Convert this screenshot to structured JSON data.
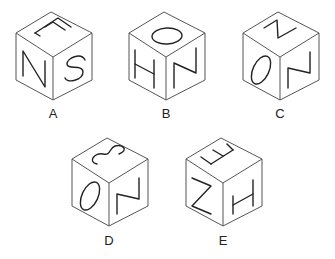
{
  "puzzle": {
    "type": "cube-net-options",
    "options": [
      {
        "label": "A",
        "faces": {
          "top": "F (rotated)",
          "left": "N",
          "right": "S"
        }
      },
      {
        "label": "B",
        "faces": {
          "top": "O",
          "left": "H (rotated)",
          "right": "N"
        }
      },
      {
        "label": "C",
        "faces": {
          "top": "N (rotated)",
          "left": "O",
          "right": "N"
        }
      },
      {
        "label": "D",
        "faces": {
          "top": "S (rotated)",
          "left": "O",
          "right": "N"
        }
      },
      {
        "label": "E",
        "faces": {
          "top": "F (rotated)",
          "left": "N (rotated)",
          "right": "H (rotated)"
        }
      }
    ]
  },
  "labels": {
    "a": "A",
    "b": "B",
    "c": "C",
    "d": "D",
    "e": "E"
  }
}
